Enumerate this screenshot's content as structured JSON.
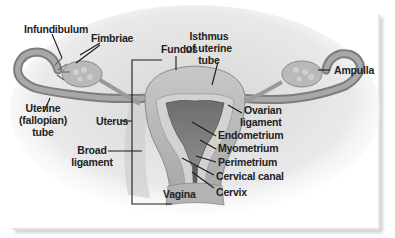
{
  "diagram": {
    "labels": {
      "infundibulum": "Infundibulum",
      "fimbriae": "Fimbriae",
      "fundus": "Fundus",
      "isthmus_1": "Isthmus",
      "isthmus_2": "of uterine",
      "isthmus_3": "tube",
      "ampulla": "Ampulla",
      "uterine_tube_1": "Uterine",
      "uterine_tube_2": "(fallopian)",
      "uterine_tube_3": "tube",
      "uterus": "Uterus",
      "ovarian_ligament_1": "Ovarian",
      "ovarian_ligament_2": "ligament",
      "broad_ligament_1": "Broad",
      "broad_ligament_2": "ligament",
      "endometrium": "Endometrium",
      "myometrium": "Myometrium",
      "perimetrium": "Perimetrium",
      "cervical_canal": "Cervical canal",
      "vagina": "Vagina",
      "cervix": "Cervix"
    },
    "colors": {
      "tissue_light": "#bdbdbd",
      "tissue_mid": "#8f8f8f",
      "tissue_dark": "#5f5f5f",
      "label_text": "#222222",
      "card_background": "#ffffff"
    }
  }
}
